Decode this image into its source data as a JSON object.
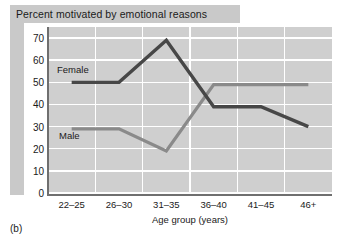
{
  "title": "Percent motivated by emotional reasons",
  "panel_caption": "(b)",
  "series_labels": {
    "female": "Female",
    "male": "Male"
  },
  "colors": {
    "female_line": "#474747",
    "male_line": "#8a8a8a",
    "plot_background": "#cfcfcf",
    "gridline": "#ffffff",
    "axis": "#6f6f6f",
    "title_band": "#c9c9c9",
    "text": "#1a1a1a"
  },
  "chart_data": {
    "type": "line",
    "title": "Percent motivated by emotional reasons",
    "xlabel": "Age group (years)",
    "ylabel": "",
    "categories": [
      "22–25",
      "26–30",
      "31–35",
      "36–40",
      "41–45",
      "46+"
    ],
    "ylim": [
      0,
      75
    ],
    "yticks": [
      0,
      10,
      20,
      30,
      40,
      50,
      60,
      70
    ],
    "ytick_labels": [
      "0",
      "10",
      "20",
      "30",
      "40",
      "50",
      "60",
      "70"
    ],
    "grid": "horizontal and vertical white gridlines",
    "legend": "inline series labels on plot",
    "series": [
      {
        "name": "Female",
        "color": "#474747",
        "values": [
          50,
          50,
          69,
          39,
          39,
          30
        ]
      },
      {
        "name": "Male",
        "color": "#8a8a8a",
        "values": [
          29,
          29,
          19,
          49,
          49,
          49
        ]
      }
    ]
  }
}
